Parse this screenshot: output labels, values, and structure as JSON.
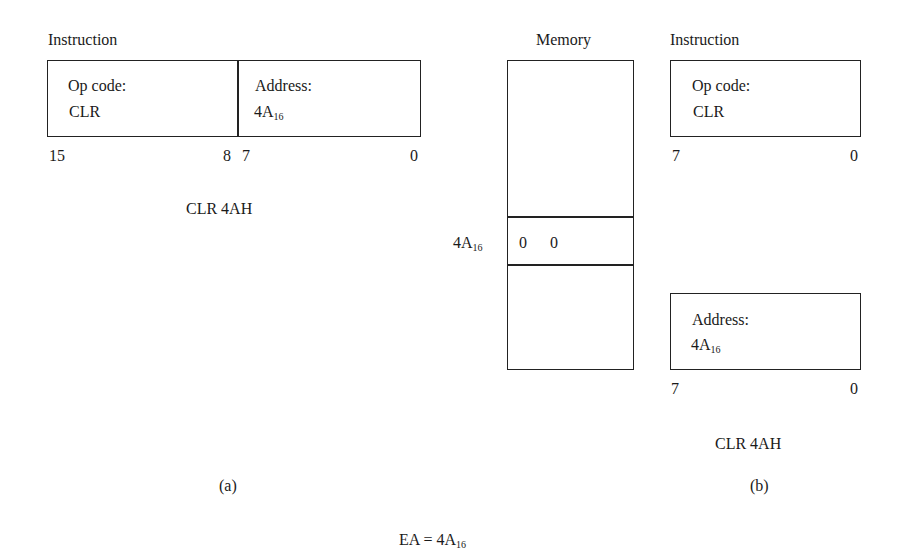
{
  "figure_a": {
    "title": "Instruction",
    "opcode_label": "Op code:",
    "opcode_value": "CLR",
    "address_label": "Address:",
    "address_value": "4A",
    "address_subscript": "16",
    "bit_15": "15",
    "bit_8": "8",
    "bit_7": "7",
    "bit_0": "0",
    "mnemonic": "CLR 4AH",
    "caption": "(a)"
  },
  "memory": {
    "title": "Memory",
    "row_address": "4A",
    "row_address_subscript": "16",
    "row_value_1": "0",
    "row_value_2": "0"
  },
  "figure_b": {
    "title": "Instruction",
    "word1": {
      "opcode_label": "Op code:",
      "opcode_value": "CLR",
      "bit_7": "7",
      "bit_0": "0"
    },
    "word2": {
      "address_label": "Address:",
      "address_value": "4A",
      "address_subscript": "16",
      "bit_7": "7",
      "bit_0": "0"
    },
    "mnemonic": "CLR 4AH",
    "caption": "(b)"
  },
  "footer": {
    "ea_label": "EA = ",
    "ea_value": "4A",
    "ea_subscript": "16"
  }
}
